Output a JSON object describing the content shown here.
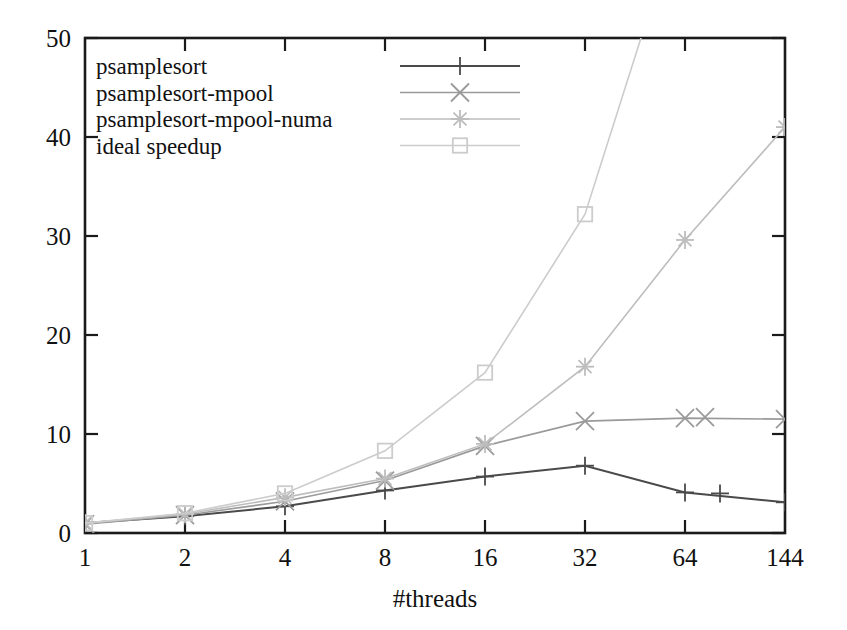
{
  "chart_data": {
    "type": "line",
    "title": "",
    "xlabel": "#threads",
    "ylabel": "",
    "categories": [
      "1",
      "2",
      "4",
      "8",
      "16",
      "32",
      "64",
      "144"
    ],
    "x_tick_labels": [
      "1",
      "2",
      "4",
      "8",
      "16",
      "32",
      "64",
      "144"
    ],
    "y_tick_labels": [
      "0",
      "10",
      "20",
      "30",
      "40",
      "50"
    ],
    "y_ticks": [
      0,
      10,
      20,
      30,
      40,
      50
    ],
    "ylim": [
      0,
      50
    ],
    "xlim_note": "categorical evenly spaced axis",
    "grid": false,
    "legend_position": "top-left inside plot",
    "series": [
      {
        "name": "psamplesort",
        "marker": "plus",
        "color": "#4a4a4a",
        "values": [
          1.0,
          1.7,
          2.7,
          4.3,
          5.7,
          6.8,
          4.1,
          3.1
        ]
      },
      {
        "name": "psamplesort-mpool",
        "marker": "cross",
        "color": "#9a9a9a",
        "values": [
          0.9,
          1.8,
          3.2,
          5.3,
          8.8,
          11.3,
          11.6,
          11.5
        ]
      },
      {
        "name": "psamplesort-mpool-numa",
        "marker": "star",
        "color": "#bdbdbd",
        "values": [
          1.0,
          1.9,
          3.6,
          5.5,
          9.0,
          16.8,
          29.6,
          41.0
        ]
      },
      {
        "name": "ideal speedup",
        "marker": "square",
        "color": "#cccccc",
        "values": [
          1.0,
          2.0,
          4.0,
          8.3,
          16.2,
          32.2,
          64.0,
          144.0
        ]
      }
    ],
    "extra_points": [
      {
        "series": "psamplesort",
        "x_position": 6.35,
        "value": 4.0,
        "note": "unlabeled marker between 64 and 144"
      },
      {
        "series": "psamplesort-mpool",
        "x_position": 6.2,
        "value": 11.7,
        "note": "unlabeled marker near 64"
      }
    ]
  },
  "legend": {
    "entries": [
      {
        "label": "psamplesort",
        "marker": "plus"
      },
      {
        "label": "psamplesort-mpool",
        "marker": "cross"
      },
      {
        "label": "psamplesort-mpool-numa",
        "marker": "star"
      },
      {
        "label": "ideal speedup",
        "marker": "square"
      }
    ]
  },
  "colors": {
    "axis": "#1a1a1a",
    "psamplesort": "#4a4a4a",
    "psamplesort_mpool": "#9a9a9a",
    "psamplesort_mpool_numa": "#bdbdbd",
    "ideal_speedup": "#cccccc",
    "background": "#ffffff"
  }
}
